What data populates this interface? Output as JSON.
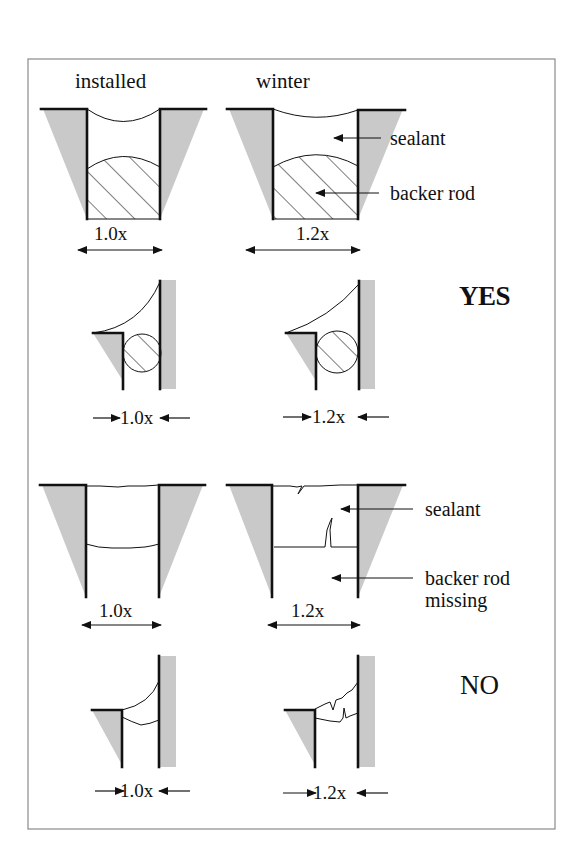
{
  "figure": {
    "column_headers": {
      "installed": "installed",
      "winter": "winter"
    },
    "colors": {
      "frame": "#8a8a8a",
      "substrate_fill": "#c9c9c9",
      "ink": "#111111",
      "background": "#ffffff"
    },
    "rows": [
      {
        "id": "yes-butt-joint",
        "panels": [
          {
            "state": "installed",
            "dimension_label": "1.0x",
            "backer_rod": "present",
            "sealant": "intact"
          },
          {
            "state": "winter",
            "dimension_label": "1.2x",
            "backer_rod": "present",
            "sealant": "intact",
            "callouts": [
              "sealant",
              "backer rod"
            ]
          }
        ]
      },
      {
        "id": "yes-corner-joint",
        "verdict": "YES",
        "panels": [
          {
            "state": "installed",
            "dimension_label": "1.0x",
            "backer_rod": "present",
            "sealant": "intact"
          },
          {
            "state": "winter",
            "dimension_label": "1.2x",
            "backer_rod": "present",
            "sealant": "intact"
          }
        ]
      },
      {
        "id": "no-butt-joint",
        "panels": [
          {
            "state": "installed",
            "dimension_label": "1.0x",
            "backer_rod": "missing",
            "sealant": "intact"
          },
          {
            "state": "winter",
            "dimension_label": "1.2x",
            "backer_rod": "missing",
            "sealant": "cracked",
            "callouts": [
              "sealant",
              "backer rod",
              "missing"
            ]
          }
        ]
      },
      {
        "id": "no-corner-joint",
        "verdict": "NO",
        "panels": [
          {
            "state": "installed",
            "dimension_label": "1.0x",
            "backer_rod": "missing",
            "sealant": "intact"
          },
          {
            "state": "winter",
            "dimension_label": "1.2x",
            "backer_rod": "missing",
            "sealant": "cracked"
          }
        ]
      }
    ],
    "labels": {
      "installed": "installed",
      "winter": "winter",
      "sealant": "sealant",
      "backer_rod": "backer rod",
      "missing": "missing",
      "yes": "YES",
      "no": "NO",
      "dim_installed": "1.0x",
      "dim_winter": "1.2x"
    }
  }
}
